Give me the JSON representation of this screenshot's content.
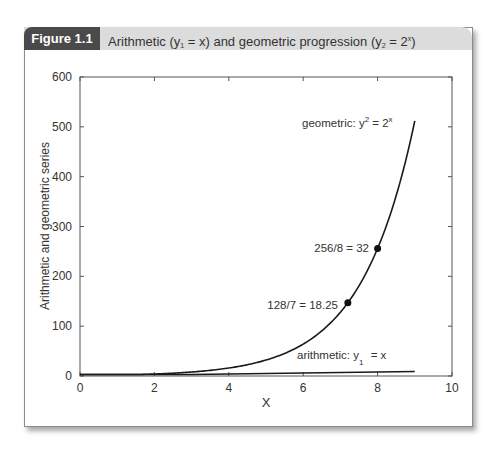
{
  "figure": {
    "tag": "Figure 1.1",
    "caption_prefix": "Arithmetic (y",
    "caption_sub1": "1",
    "caption_mid": " = x) and geometric progression (y",
    "caption_sub2": "2",
    "caption_mid2": " = 2",
    "caption_sup": "x",
    "caption_suffix": ")"
  },
  "colors": {
    "tag_bg": "#4a4a4a",
    "header_bg": "#dcdcdc",
    "line": "#1a1a1a"
  },
  "chart_data": {
    "type": "line",
    "xlabel": "X",
    "ylabel": "Arithmetic and geometric series",
    "xlim": [
      0,
      10
    ],
    "ylim": [
      0,
      600
    ],
    "xticks": [
      0,
      2,
      4,
      6,
      8,
      10
    ],
    "yticks": [
      0,
      100,
      200,
      300,
      400,
      500,
      600
    ],
    "grid": false,
    "series": [
      {
        "name": "geometric",
        "label": "geometric: y2 = 2^x",
        "x": [
          0,
          1,
          2,
          3,
          4,
          5,
          6,
          7,
          8,
          9
        ],
        "y": [
          1,
          2,
          4,
          8,
          16,
          32,
          64,
          128,
          256,
          512
        ]
      },
      {
        "name": "arithmetic",
        "label": "arithmetic: y1 = x",
        "x": [
          0,
          1,
          2,
          3,
          4,
          5,
          6,
          7,
          8,
          9
        ],
        "y": [
          0,
          1,
          2,
          3,
          4,
          5,
          6,
          7,
          8,
          9
        ]
      }
    ],
    "annotations": [
      {
        "text": "128/7 = 18.25",
        "x": 7.2,
        "y": 147,
        "marker": "dot"
      },
      {
        "text": "256/8 = 32",
        "x": 8,
        "y": 256,
        "marker": "dot"
      },
      {
        "text": "geometric: y² = 2ˣ",
        "x": 6.1,
        "y": 505
      },
      {
        "text": "arithmetic: y₁ = x",
        "x": 6.0,
        "y": 25
      }
    ]
  },
  "labels": {
    "xlabel": "X",
    "ylabel": "Arithmetic and geometric series",
    "geo_label_main": "geometric: y",
    "geo_label_sup": "2",
    "geo_label_rest": " = 2",
    "geo_label_sup2": "x",
    "ari_label_main": "arithmetic: y",
    "ari_label_sub": "1",
    "ari_label_rest": " = x",
    "pt1": "128/7 = 18.25",
    "pt2": "256/8 = 32"
  },
  "ticks": {
    "x": [
      "0",
      "2",
      "4",
      "6",
      "8",
      "10"
    ],
    "y": [
      "0",
      "100",
      "200",
      "300",
      "400",
      "500",
      "600"
    ]
  }
}
